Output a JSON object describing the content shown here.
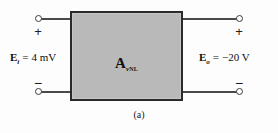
{
  "figure": {
    "caption": "(a)",
    "block": {
      "gain_symbol": "A",
      "gain_subscript_v": "v",
      "gain_subscript_nl": "NL",
      "fill_color": "#b9b9b9",
      "border_color": "#2a2a2a"
    },
    "input": {
      "symbol": "E",
      "subscript": "i",
      "equals": "=",
      "value": "4 mV",
      "plus_sign": "+",
      "minus_sign": "−"
    },
    "output": {
      "symbol": "E",
      "subscript": "o",
      "equals": "=",
      "value": "−20 V",
      "plus_sign": "+",
      "minus_sign": "−"
    }
  }
}
